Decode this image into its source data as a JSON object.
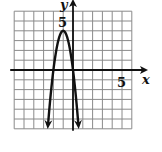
{
  "chart_data": {
    "type": "line",
    "title": "",
    "xlabel": "x",
    "ylabel": "y",
    "xlim": [
      -6,
      6
    ],
    "ylim": [
      -6,
      6
    ],
    "grid": true,
    "grid_step": 1,
    "tick_labels": {
      "x": [
        {
          "value": 5,
          "label": "5"
        }
      ],
      "y": [
        {
          "value": 5,
          "label": "5"
        }
      ]
    },
    "series": [
      {
        "name": "parabola",
        "equation": "y = -4(x + 1)^2 + 4",
        "vertex": [
          -1,
          4
        ],
        "x_intercepts": [
          -2,
          0
        ],
        "opens": "down",
        "arrows_at_ends": true,
        "x": [
          -2.55,
          -2.5,
          -2,
          -1.5,
          -1,
          -0.5,
          0,
          0.5,
          0.55
        ],
        "y": [
          -5.6,
          -5.0,
          0,
          3,
          4,
          3,
          0,
          -5.0,
          -5.6
        ]
      }
    ],
    "legend": null
  },
  "labels": {
    "x_axis": "x",
    "y_axis": "y",
    "x_tick": "5",
    "y_tick": "5"
  },
  "colors": {
    "grid": "#8a8a8a",
    "axis": "#111111",
    "curve": "#111111",
    "background": "#ffffff"
  }
}
